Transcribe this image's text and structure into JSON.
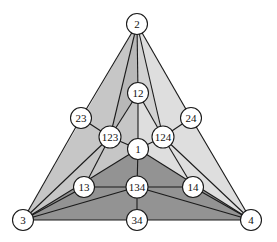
{
  "diagram": {
    "type": "triangulated-simplex-subdivision",
    "colors": {
      "background": "#ffffff",
      "face_left": "#c6c6c6",
      "face_left_inner": "#b8b8b8",
      "face_right": "#dedede",
      "face_right_inner": "#d2d2d2",
      "face_bottom": "#939393",
      "stroke": "#1a1a1a",
      "node_fill": "#ffffff"
    },
    "nodes": [
      {
        "id": "2",
        "label": "2",
        "x": 137,
        "y": 24
      },
      {
        "id": "3",
        "label": "3",
        "x": 23,
        "y": 220
      },
      {
        "id": "4",
        "label": "4",
        "x": 251,
        "y": 220
      },
      {
        "id": "12",
        "label": "12",
        "x": 138,
        "y": 93
      },
      {
        "id": "23",
        "label": "23",
        "x": 81,
        "y": 118
      },
      {
        "id": "24",
        "label": "24",
        "x": 191,
        "y": 118
      },
      {
        "id": "123",
        "label": "123",
        "x": 110,
        "y": 137
      },
      {
        "id": "124",
        "label": "124",
        "x": 163,
        "y": 137
      },
      {
        "id": "1",
        "label": "1",
        "x": 138,
        "y": 149
      },
      {
        "id": "13",
        "label": "13",
        "x": 84,
        "y": 187
      },
      {
        "id": "134",
        "label": "134",
        "x": 137,
        "y": 187
      },
      {
        "id": "14",
        "label": "14",
        "x": 193,
        "y": 187
      },
      {
        "id": "34",
        "label": "34",
        "x": 137,
        "y": 220
      }
    ],
    "edges": [
      [
        "2",
        "23"
      ],
      [
        "23",
        "3"
      ],
      [
        "3",
        "34"
      ],
      [
        "34",
        "4"
      ],
      [
        "4",
        "24"
      ],
      [
        "24",
        "2"
      ],
      [
        "2",
        "123"
      ],
      [
        "2",
        "12"
      ],
      [
        "2",
        "124"
      ],
      [
        "12",
        "123"
      ],
      [
        "12",
        "124"
      ],
      [
        "12",
        "1"
      ],
      [
        "23",
        "123"
      ],
      [
        "24",
        "124"
      ],
      [
        "123",
        "1"
      ],
      [
        "124",
        "1"
      ],
      [
        "123",
        "3"
      ],
      [
        "123",
        "13"
      ],
      [
        "124",
        "4"
      ],
      [
        "124",
        "14"
      ],
      [
        "1",
        "3"
      ],
      [
        "1",
        "4"
      ],
      [
        "1",
        "134"
      ],
      [
        "13",
        "134"
      ],
      [
        "134",
        "14"
      ],
      [
        "13",
        "3"
      ],
      [
        "14",
        "4"
      ],
      [
        "134",
        "3"
      ],
      [
        "134",
        "4"
      ],
      [
        "134",
        "34"
      ]
    ]
  }
}
